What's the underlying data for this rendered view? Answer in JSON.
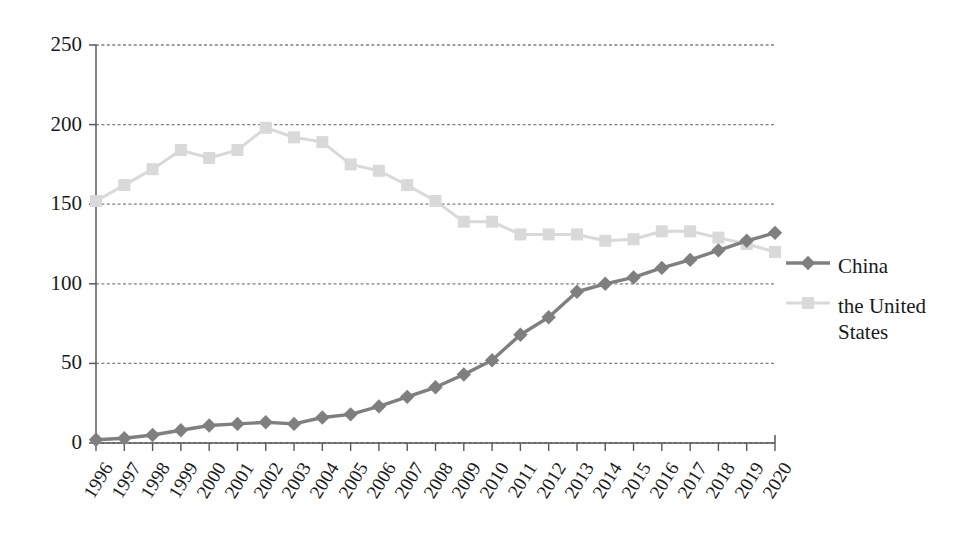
{
  "chart_data": {
    "type": "line",
    "title": "",
    "xlabel": "",
    "ylabel": "",
    "grid": true,
    "legend_position": "right",
    "xlim": [
      1996,
      2020
    ],
    "ylim": [
      0,
      250
    ],
    "yticks": [
      0,
      50,
      100,
      150,
      200,
      250
    ],
    "categories": [
      "1996",
      "1997",
      "1998",
      "1999",
      "2000",
      "2001",
      "2002",
      "2003",
      "2004",
      "2005",
      "2006",
      "2007",
      "2008",
      "2009",
      "2010",
      "2011",
      "2012",
      "2013",
      "2014",
      "2015",
      "2016",
      "2017",
      "2018",
      "2019",
      "2020"
    ],
    "series": [
      {
        "name": "China",
        "color": "#7f7f7f",
        "marker": "diamond",
        "values": [
          2,
          3,
          5,
          8,
          11,
          12,
          13,
          12,
          16,
          18,
          23,
          29,
          35,
          43,
          52,
          68,
          79,
          95,
          100,
          104,
          110,
          115,
          121,
          127,
          132
        ]
      },
      {
        "name": "the United States",
        "color": "#d9d9d9",
        "marker": "square",
        "values": [
          152,
          162,
          172,
          184,
          179,
          184,
          198,
          192,
          189,
          175,
          171,
          162,
          152,
          139,
          139,
          131,
          131,
          131,
          127,
          128,
          133,
          133,
          129,
          125,
          120
        ]
      }
    ]
  },
  "axes": {
    "y_tick_labels": [
      "250",
      "200",
      "150",
      "100",
      "50",
      "0"
    ],
    "x_tick_labels": [
      "1996",
      "1997",
      "1998",
      "1999",
      "2000",
      "2001",
      "2002",
      "2003",
      "2004",
      "2005",
      "2006",
      "2007",
      "2008",
      "2009",
      "2010",
      "2011",
      "2012",
      "2013",
      "2014",
      "2015",
      "2016",
      "2017",
      "2018",
      "2019",
      "2020"
    ]
  },
  "legend": {
    "entries": [
      {
        "label": "China",
        "label_line1": "China",
        "label_line2": ""
      },
      {
        "label": "the United States",
        "label_line1": "the United",
        "label_line2": "States"
      }
    ]
  },
  "colors": {
    "china_series": "#7f7f7f",
    "us_series": "#d9d9d9",
    "axis": "#595959",
    "gridline": "#808080",
    "text": "#1a1a1a",
    "background": "#ffffff"
  }
}
